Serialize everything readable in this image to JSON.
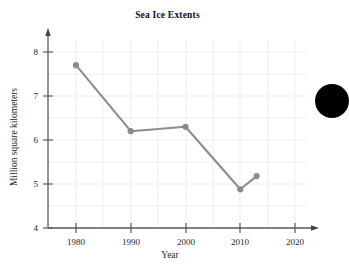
{
  "chart_data": {
    "type": "line",
    "title": "Sea Ice Extents",
    "xlabel": "Year",
    "ylabel": "Million square kilometers",
    "x": [
      1980,
      1990,
      2000,
      2010,
      2013
    ],
    "values": [
      7.7,
      6.2,
      6.3,
      4.88,
      5.18
    ],
    "series": [
      {
        "name": "Sea ice extent",
        "x": [
          1980,
          1990,
          2000,
          2010,
          2013
        ],
        "values": [
          7.7,
          6.2,
          6.3,
          4.88,
          5.18
        ]
      }
    ],
    "xlim": [
      1975,
      2022
    ],
    "ylim": [
      4,
      8.3
    ],
    "xticks": [
      1980,
      1990,
      2000,
      2010,
      2020
    ],
    "xtick_labels": [
      "1980",
      "1990",
      "2000",
      "2010",
      "2020"
    ],
    "yticks": [
      4,
      5,
      6,
      7,
      8
    ],
    "ytick_labels": [
      "4",
      "5",
      "6",
      "7",
      "8"
    ],
    "grid": true,
    "grid_x_step": 5,
    "grid_y_step": 0.5,
    "legend": "none",
    "marker": "circle",
    "line_color": "#8c8c8c",
    "marker_color": "#8c8c8c",
    "grid_color": "#ededed",
    "axis_color": "#595959"
  },
  "figure": {
    "title": "Sea Ice Extents",
    "x_axis_title": "Year",
    "y_axis_title": "Million square kilometers",
    "x_tick_labels": [
      "1980",
      "1990",
      "2000",
      "2010",
      "2020"
    ],
    "y_tick_labels": [
      "4",
      "5",
      "6",
      "7",
      "8"
    ],
    "background_color": "#ffffff"
  },
  "decoration": {
    "edge_blob_color": "#000000"
  }
}
